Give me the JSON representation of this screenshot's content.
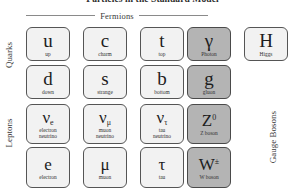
{
  "title": "Particles in the Standard Model",
  "headers": {
    "fermions": "Fermions"
  },
  "group_labels": {
    "quarks": "Quarks",
    "leptons": "Leptons",
    "gauge_bosons": "Gauge Bosons"
  },
  "colors": {
    "shaded_fill": "#b4b4b4",
    "light_fill": "#f2f2f2",
    "border": "#555555",
    "text": "#1d1d1d"
  },
  "particles": [
    {
      "symbol": "u",
      "sub": "",
      "sup": "",
      "caption": "up",
      "shaded": false
    },
    {
      "symbol": "c",
      "sub": "",
      "sup": "",
      "caption": "charm",
      "shaded": false
    },
    {
      "symbol": "t",
      "sub": "",
      "sup": "",
      "caption": "top",
      "shaded": false
    },
    {
      "symbol": "γ",
      "sub": "",
      "sup": "",
      "caption": "Photon",
      "shaded": true
    },
    {
      "symbol": "H",
      "sub": "",
      "sup": "",
      "caption": "Higgs",
      "shaded": false
    },
    {
      "symbol": "d",
      "sub": "",
      "sup": "",
      "caption": "down",
      "shaded": false
    },
    {
      "symbol": "s",
      "sub": "",
      "sup": "",
      "caption": "strange",
      "shaded": false
    },
    {
      "symbol": "b",
      "sub": "",
      "sup": "",
      "caption": "bottom",
      "shaded": false
    },
    {
      "symbol": "g",
      "sub": "",
      "sup": "",
      "caption": "gluon",
      "shaded": true
    },
    {
      "symbol": "",
      "sub": "",
      "sup": "",
      "caption": "",
      "shaded": false
    },
    {
      "symbol": "ν",
      "sub": "e",
      "sup": "",
      "caption": "electron\nneutrino",
      "shaded": false
    },
    {
      "symbol": "ν",
      "sub": "μ",
      "sup": "",
      "caption": "muon\nneutrino",
      "shaded": false
    },
    {
      "symbol": "ν",
      "sub": "τ",
      "sup": "",
      "caption": "tau\nneutrino",
      "shaded": false
    },
    {
      "symbol": "Z",
      "sub": "",
      "sup": "0",
      "caption": "Z boson",
      "shaded": true
    },
    {
      "symbol": "",
      "sub": "",
      "sup": "",
      "caption": "",
      "shaded": false
    },
    {
      "symbol": "e",
      "sub": "",
      "sup": "",
      "caption": "electron",
      "shaded": false
    },
    {
      "symbol": "μ",
      "sub": "",
      "sup": "",
      "caption": "muon",
      "shaded": false
    },
    {
      "symbol": "τ",
      "sub": "",
      "sup": "",
      "caption": "tau",
      "shaded": false
    },
    {
      "symbol": "W",
      "sub": "",
      "sup": "±",
      "caption": "W boson",
      "shaded": true
    },
    {
      "symbol": "",
      "sub": "",
      "sup": "",
      "caption": "",
      "shaded": false
    }
  ]
}
